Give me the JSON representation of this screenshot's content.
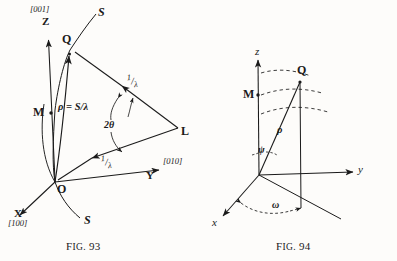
{
  "figure_set": {
    "description": "Two line diagrams of reciprocal-lattice / sphere-of-reflection geometry",
    "background_color": "#fdfcfa",
    "ink_color": "#1a1a1a"
  },
  "fig93": {
    "caption_prefix": "F",
    "caption_small_caps": "IG.",
    "caption_number": "93",
    "caption_full": "Fig. 93",
    "points": {
      "origin": "O",
      "reciprocal_point": "Q",
      "midpoint": "M",
      "source": "L"
    },
    "axes": [
      {
        "name": "z-axis",
        "label": "Z",
        "index": "[001]"
      },
      {
        "name": "y-axis",
        "label": "Y",
        "index": "[010]"
      },
      {
        "name": "x-axis",
        "label": "X",
        "index": "[100]"
      }
    ],
    "curve_labels": [
      {
        "name": "sphere-top",
        "text": "S"
      },
      {
        "name": "sphere-bottom",
        "text": "S"
      }
    ],
    "vectors": [
      {
        "name": "rho-vector",
        "text": "ρ = S/λ"
      },
      {
        "name": "incident-beam",
        "numerator": "1",
        "denominator": "λ"
      },
      {
        "name": "diffracted-beam",
        "numerator": "1",
        "denominator": "λ"
      }
    ],
    "angles": [
      {
        "name": "two-theta",
        "text": "2θ"
      }
    ]
  },
  "fig94": {
    "caption_prefix": "F",
    "caption_small_caps": "IG.",
    "caption_number": "94",
    "caption_full": "Fig. 94",
    "points": {
      "reciprocal_point": "Q",
      "projection_point": "M"
    },
    "axes": [
      {
        "name": "z-axis",
        "label": "z"
      },
      {
        "name": "y-axis",
        "label": "y"
      },
      {
        "name": "x-axis",
        "label": "x"
      }
    ],
    "angles": [
      {
        "name": "psi-angle",
        "text": "ψ"
      },
      {
        "name": "omega-angle",
        "text": "ω"
      }
    ],
    "vectors": [
      {
        "name": "rho-vector",
        "text": "ρ"
      }
    ]
  }
}
